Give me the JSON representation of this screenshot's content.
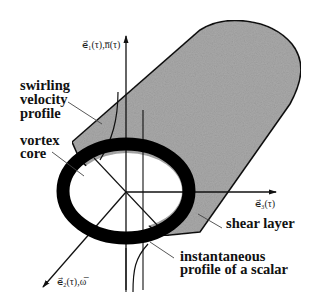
{
  "diagram": {
    "type": "vortex-tube schematic",
    "labels": {
      "swirling": [
        "swirling",
        "velocity",
        "profile"
      ],
      "vortex_core": [
        "vortex",
        "core"
      ],
      "shear_layer": "shear layer",
      "scalar": [
        "instantaneous",
        "profile of a scalar"
      ]
    },
    "axes": {
      "vertical": "e⃗₁(τ),n̅(τ)",
      "horizontal": "e⃗₃(τ)",
      "diagonal": "e⃗₂(τ),ω̅"
    },
    "colors": {
      "tube_fill": "#a8a8a8",
      "ring": "#000000",
      "lines": "#111111"
    }
  }
}
